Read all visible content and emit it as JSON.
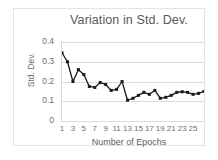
{
  "chart_data": {
    "type": "line",
    "title": "Variation in Std. Dev.",
    "xlabel": "Number of Epochs",
    "ylabel": "Std. Dev.",
    "x": [
      1,
      2,
      3,
      4,
      5,
      6,
      7,
      8,
      9,
      10,
      11,
      12,
      13,
      14,
      15,
      16,
      17,
      18,
      19,
      20,
      21,
      22,
      23,
      24,
      25,
      26,
      27
    ],
    "values": [
      0.345,
      0.3,
      0.2,
      0.26,
      0.235,
      0.175,
      0.17,
      0.195,
      0.185,
      0.155,
      0.16,
      0.2,
      0.105,
      0.115,
      0.13,
      0.145,
      0.135,
      0.155,
      0.115,
      0.12,
      0.13,
      0.145,
      0.148,
      0.145,
      0.135,
      0.14,
      0.15
    ],
    "ylim": [
      0,
      0.4
    ],
    "xlim": [
      1,
      27
    ],
    "yticks": [
      0,
      0.1,
      0.2,
      0.3,
      0.4
    ],
    "ytick_labels": [
      "0",
      "0.1",
      "0.2",
      "0.3",
      "0.4"
    ],
    "xticks": [
      1,
      3,
      5,
      7,
      9,
      11,
      13,
      15,
      17,
      19,
      21,
      23,
      25
    ],
    "xtick_labels": [
      "1",
      "3",
      "5",
      "7",
      "9",
      "11",
      "13",
      "15",
      "17",
      "19",
      "21",
      "23",
      "25"
    ],
    "grid": true,
    "legend": null,
    "marker": "square",
    "line_color": "#1a1a1a",
    "grid_color": "#dcdcdc",
    "text_color": "#6d6d6d"
  }
}
